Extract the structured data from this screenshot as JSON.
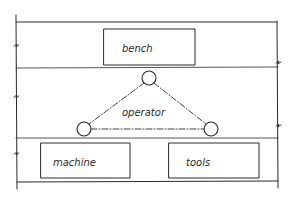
{
  "diagram": {
    "type": "hand-drawn workstation layout",
    "zones": [
      {
        "id": "top-zone",
        "contains": "bench"
      },
      {
        "id": "middle-zone",
        "contains": "operator"
      },
      {
        "id": "bottom-zone",
        "contains": [
          "machine",
          "tools"
        ]
      }
    ],
    "boxes": {
      "bench": {
        "label": "bench"
      },
      "machine": {
        "label": "machine"
      },
      "tools": {
        "label": "tools"
      }
    },
    "operator": {
      "label": "operator",
      "nodes": [
        "top-node",
        "left-node",
        "right-node"
      ],
      "connector_style": "dash-dot"
    },
    "colors": {
      "ink": "#2a2a2a",
      "background": "#ffffff"
    }
  }
}
